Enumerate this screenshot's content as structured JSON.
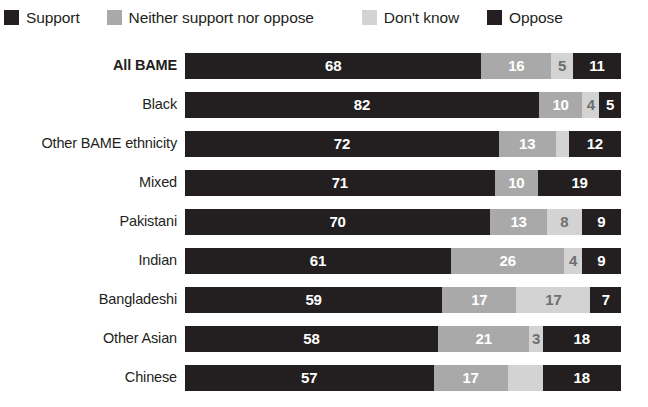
{
  "chart_data": {
    "type": "bar",
    "subtype": "stacked-horizontal-100",
    "title": "",
    "xlabel": "",
    "ylabel": "",
    "xlim": [
      0,
      100
    ],
    "grid": false,
    "legend_position": "top-left",
    "categories": [
      "All BAME",
      "Black",
      "Other BAME ethnicity",
      "Mixed",
      "Pakistani",
      "Indian",
      "Bangladeshi",
      "Other Asian",
      "Chinese"
    ],
    "series": [
      {
        "name": "Support",
        "color": "#231f20",
        "values": [
          68,
          82,
          72,
          71,
          70,
          61,
          59,
          58,
          57
        ]
      },
      {
        "name": "Neither support nor oppose",
        "color": "#a9a9a9",
        "values": [
          16,
          10,
          13,
          10,
          13,
          26,
          17,
          21,
          17
        ]
      },
      {
        "name": "Don't know",
        "color": "#d3d3d3",
        "values": [
          5,
          4,
          3,
          0,
          8,
          4,
          17,
          3,
          8
        ]
      },
      {
        "name": "Oppose",
        "color": "#231f20",
        "values": [
          11,
          5,
          12,
          19,
          9,
          9,
          7,
          18,
          18
        ]
      }
    ]
  },
  "legend": {
    "items": [
      {
        "label": "Support",
        "color": "#231f20"
      },
      {
        "label": "Neither support nor oppose",
        "color": "#a9a9a9"
      },
      {
        "label": "Don't know",
        "color": "#d3d3d3"
      },
      {
        "label": "Oppose",
        "color": "#231f20"
      }
    ]
  },
  "rows": [
    {
      "label": "All BAME",
      "emphasis": true,
      "segments": [
        {
          "key": "support",
          "value": 68,
          "label": "68"
        },
        {
          "key": "neither",
          "value": 16,
          "label": "16"
        },
        {
          "key": "dontknow",
          "value": 5,
          "label": "5"
        },
        {
          "key": "oppose",
          "value": 11,
          "label": "11"
        }
      ]
    },
    {
      "label": "Black",
      "emphasis": false,
      "segments": [
        {
          "key": "support",
          "value": 82,
          "label": "82"
        },
        {
          "key": "neither",
          "value": 10,
          "label": "10"
        },
        {
          "key": "dontknow",
          "value": 4,
          "label": "4"
        },
        {
          "key": "oppose",
          "value": 5,
          "label": "5"
        }
      ]
    },
    {
      "label": "Other BAME ethnicity",
      "emphasis": false,
      "segments": [
        {
          "key": "support",
          "value": 72,
          "label": "72"
        },
        {
          "key": "neither",
          "value": 13,
          "label": "13"
        },
        {
          "key": "dontknow",
          "value": 3,
          "label": ""
        },
        {
          "key": "oppose",
          "value": 12,
          "label": "12"
        }
      ]
    },
    {
      "label": "Mixed",
      "emphasis": false,
      "segments": [
        {
          "key": "support",
          "value": 71,
          "label": "71"
        },
        {
          "key": "neither",
          "value": 10,
          "label": "10"
        },
        {
          "key": "dontknow",
          "value": 0,
          "label": ""
        },
        {
          "key": "oppose",
          "value": 19,
          "label": "19"
        }
      ]
    },
    {
      "label": "Pakistani",
      "emphasis": false,
      "segments": [
        {
          "key": "support",
          "value": 70,
          "label": "70"
        },
        {
          "key": "neither",
          "value": 13,
          "label": "13"
        },
        {
          "key": "dontknow",
          "value": 8,
          "label": "8"
        },
        {
          "key": "oppose",
          "value": 9,
          "label": "9"
        }
      ]
    },
    {
      "label": "Indian",
      "emphasis": false,
      "segments": [
        {
          "key": "support",
          "value": 61,
          "label": "61"
        },
        {
          "key": "neither",
          "value": 26,
          "label": "26"
        },
        {
          "key": "dontknow",
          "value": 4,
          "label": "4"
        },
        {
          "key": "oppose",
          "value": 9,
          "label": "9"
        }
      ]
    },
    {
      "label": "Bangladeshi",
      "emphasis": false,
      "segments": [
        {
          "key": "support",
          "value": 59,
          "label": "59"
        },
        {
          "key": "neither",
          "value": 17,
          "label": "17"
        },
        {
          "key": "dontknow",
          "value": 17,
          "label": "17"
        },
        {
          "key": "oppose",
          "value": 7,
          "label": "7"
        }
      ]
    },
    {
      "label": "Other Asian",
      "emphasis": false,
      "segments": [
        {
          "key": "support",
          "value": 58,
          "label": "58"
        },
        {
          "key": "neither",
          "value": 21,
          "label": "21"
        },
        {
          "key": "dontknow",
          "value": 3,
          "label": "3"
        },
        {
          "key": "oppose",
          "value": 18,
          "label": "18"
        }
      ]
    },
    {
      "label": "Chinese",
      "emphasis": false,
      "segments": [
        {
          "key": "support",
          "value": 57,
          "label": "57"
        },
        {
          "key": "neither",
          "value": 17,
          "label": "17"
        },
        {
          "key": "dontknow",
          "value": 8,
          "label": ""
        },
        {
          "key": "oppose",
          "value": 18,
          "label": "18"
        }
      ]
    }
  ]
}
